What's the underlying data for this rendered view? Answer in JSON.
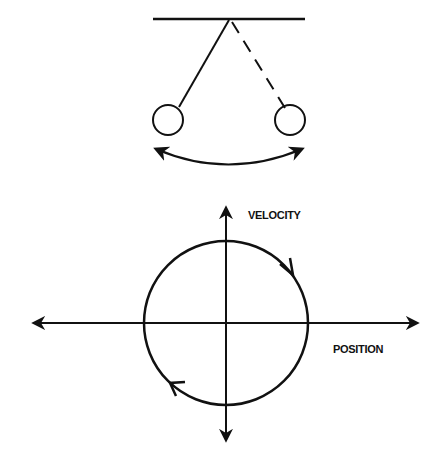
{
  "pendulum": {
    "description": "Pendulum swinging between two extreme positions",
    "left_bob": "solid string",
    "right_bob": "dashed string",
    "swing_arrow": "double-headed arc"
  },
  "phase_plot": {
    "y_axis_label": "VELOCITY",
    "x_axis_label": "POSITION",
    "trajectory": "circle",
    "direction": "clockwise"
  },
  "colors": {
    "ink": "#111111",
    "background": "#ffffff"
  }
}
